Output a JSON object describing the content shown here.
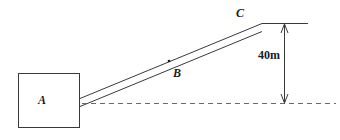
{
  "diagram": {
    "type": "inclined-ramp-elevation",
    "background_color": "#ffffff",
    "stroke_color": "#3a3a3a",
    "text_color": "#1c1c1c",
    "labels": {
      "block_a": "A",
      "point_b": "B",
      "point_c": "C",
      "height_dimension": "40m"
    },
    "elements": {
      "block": {
        "name": "A",
        "x": 18,
        "y": 73,
        "width": 62,
        "height": 55
      },
      "incline": {
        "from_x": 80,
        "from_y": 102,
        "to_x": 262,
        "to_y": 27,
        "thickness_px": 9
      },
      "point_marker_b": {
        "x": 169,
        "y": 61
      },
      "baseline_dashed": {
        "from_x": 82,
        "to_x": 336,
        "y": 103
      },
      "top_reference_line": {
        "from_x": 262,
        "to_x": 308,
        "y": 23
      },
      "height_dimension_line": {
        "x": 284,
        "top_y": 23,
        "bottom_y": 103,
        "value": "40m",
        "arrow_top": "up",
        "arrow_bottom": "down"
      }
    }
  }
}
